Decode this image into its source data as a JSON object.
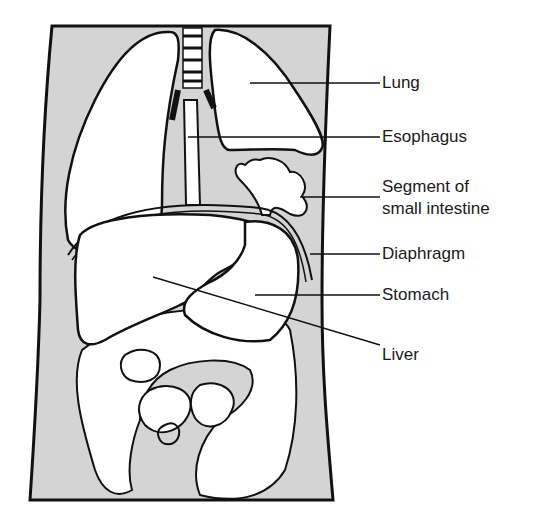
{
  "diagram": {
    "background_color": "#ffffff",
    "body_fill_color": "#d4d4d4",
    "organ_fill_color": "#ffffff",
    "outline_color": "#111111",
    "labels": [
      {
        "id": "lung",
        "text": "Lung"
      },
      {
        "id": "esophagus",
        "text": "Esophagus"
      },
      {
        "id": "small-intestine-line1",
        "text": "Segment of"
      },
      {
        "id": "small-intestine-line2",
        "text": "small intestine"
      },
      {
        "id": "diaphragm",
        "text": "Diaphragm"
      },
      {
        "id": "stomach",
        "text": "Stomach"
      },
      {
        "id": "liver",
        "text": "Liver"
      }
    ]
  }
}
